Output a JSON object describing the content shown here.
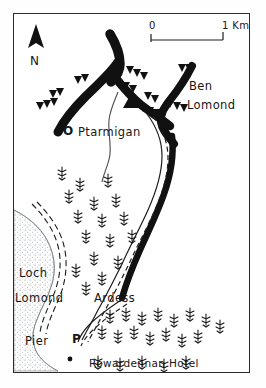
{
  "map": {
    "title": "Ben Lomond and Rowardennan, Loch Lomond sketch map",
    "style": "hand-drawn line map, black ink on white",
    "frame": {
      "x": 13,
      "y": 13,
      "width": 237,
      "height": 360
    },
    "compass": {
      "icon": "north-arrow-icon",
      "label": "N",
      "x": 22,
      "y": 18
    },
    "scale_bar": {
      "start_label": "0",
      "end_label": "1 Km.",
      "x": 150,
      "y": 30,
      "bar_length_px": 72
    },
    "labels": [
      {
        "id": "ben-lomond",
        "text": "Ben",
        "x": 188,
        "y": 72,
        "kind": "summit"
      },
      {
        "id": "ben-lomond-2",
        "text": "Lomond",
        "x": 186,
        "y": 90,
        "kind": "summit"
      },
      {
        "id": "ptarmigan",
        "text": "Ptarmigan",
        "x": 77,
        "y": 118,
        "kind": "summit"
      },
      {
        "id": "loch-lomond",
        "text": "Loch",
        "x": 18,
        "y": 263,
        "kind": "water"
      },
      {
        "id": "loch-lomond-2",
        "text": "Lomond",
        "x": 14,
        "y": 288,
        "kind": "water"
      },
      {
        "id": "ardess",
        "text": "Ardess",
        "x": 93,
        "y": 288,
        "kind": "settlement"
      },
      {
        "id": "pier",
        "text": "Pier",
        "x": 24,
        "y": 331,
        "kind": "facility"
      },
      {
        "id": "rowardennan-hotel",
        "text": "Rowardennan Hotel",
        "x": 88,
        "y": 354,
        "kind": "facility"
      }
    ],
    "markers": [
      {
        "id": "ptarmigan-marker",
        "symbol": "O",
        "x": 62,
        "y": 118,
        "name": "circle-marker-icon"
      },
      {
        "id": "pier-marker",
        "symbol": "P",
        "x": 71,
        "y": 330,
        "name": "parking-marker-icon"
      },
      {
        "id": "summit-marker",
        "symbol": "▲",
        "x": 111,
        "y": 90,
        "name": "summit-triangle-icon"
      }
    ],
    "legend_features": [
      "ridge-line",
      "crag-tick-marks",
      "footpath-dashed",
      "stream-line",
      "conifer-woodland",
      "loch-stipple"
    ],
    "colors": {
      "ink": "#171717",
      "frame": "#2b2b2b",
      "paper": "#ffffff",
      "water_stipple": "#9aa0a4",
      "woodland": "#1a1a1a"
    }
  }
}
